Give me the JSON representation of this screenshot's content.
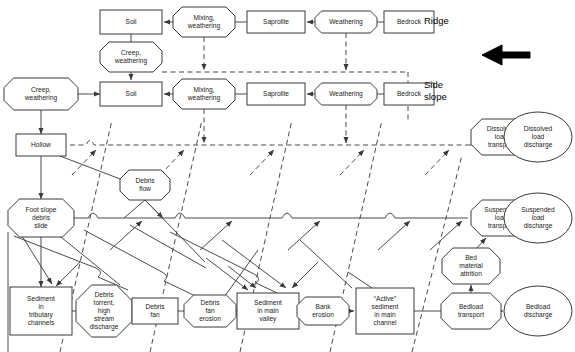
{
  "diagram": {
    "zone_labels": [
      {
        "id": "ridge",
        "text": "Ridge",
        "x": 424,
        "y": 24
      },
      {
        "id": "side-slope-1",
        "text": "Side",
        "x": 424,
        "y": 88
      },
      {
        "id": "side-slope-2",
        "text": "slope",
        "x": 424,
        "y": 100
      }
    ],
    "direction_arrow": {
      "name": "flow-direction-arrow",
      "points": "530,52 502,52 502,45 482,55 502,65 502,58 530,58",
      "tail_x": 530,
      "head_x": 482
    },
    "nodes": [
      {
        "id": "ridge-soil",
        "label": [
          "Soil"
        ],
        "shape": "rect",
        "cx": 131,
        "cy": 22,
        "w": 62,
        "h": 24
      },
      {
        "id": "ridge-mixing-weathering",
        "label": [
          "Mixing,",
          "weathering"
        ],
        "shape": "oct",
        "cx": 204,
        "cy": 22,
        "w": 62,
        "h": 30
      },
      {
        "id": "ridge-saprolite",
        "label": [
          "Saprolite"
        ],
        "shape": "rect",
        "cx": 276,
        "cy": 22,
        "w": 58,
        "h": 22
      },
      {
        "id": "ridge-weathering",
        "label": [
          "Weathering"
        ],
        "shape": "oct",
        "cx": 346,
        "cy": 22,
        "w": 62,
        "h": 22
      },
      {
        "id": "ridge-bedrock",
        "label": [
          "Bedrock"
        ],
        "shape": "rect",
        "cx": 409,
        "cy": 22,
        "w": 50,
        "h": 22
      },
      {
        "id": "ridge-creep-weathering",
        "label": [
          "Creep,",
          "weathering"
        ],
        "shape": "oct",
        "cx": 131,
        "cy": 57,
        "w": 62,
        "h": 30
      },
      {
        "id": "side-creep-weathering",
        "label": [
          "Creep,",
          "weathering"
        ],
        "shape": "oct",
        "cx": 41,
        "cy": 94,
        "w": 74,
        "h": 32
      },
      {
        "id": "side-soil",
        "label": [
          "Soil"
        ],
        "shape": "rect",
        "cx": 131,
        "cy": 94,
        "w": 62,
        "h": 24
      },
      {
        "id": "side-mixing-weathering",
        "label": [
          "Mixing,",
          "weathering"
        ],
        "shape": "oct",
        "cx": 204,
        "cy": 94,
        "w": 62,
        "h": 30
      },
      {
        "id": "side-saprolite",
        "label": [
          "Saprolite"
        ],
        "shape": "rect",
        "cx": 276,
        "cy": 94,
        "w": 58,
        "h": 22
      },
      {
        "id": "side-weathering",
        "label": [
          "Weathering"
        ],
        "shape": "oct",
        "cx": 346,
        "cy": 94,
        "w": 62,
        "h": 22
      },
      {
        "id": "side-bedrock",
        "label": [
          "Bedrock"
        ],
        "shape": "rect",
        "cx": 409,
        "cy": 94,
        "w": 50,
        "h": 22
      },
      {
        "id": "hollow",
        "label": [
          "Hollow"
        ],
        "shape": "rect",
        "cx": 41,
        "cy": 145,
        "w": 50,
        "h": 22
      },
      {
        "id": "debris-flow",
        "label": [
          "Debris",
          "flow"
        ],
        "shape": "oct",
        "cx": 145,
        "cy": 185,
        "w": 50,
        "h": 30
      },
      {
        "id": "foot-slope-debris-slide",
        "label": [
          "Foot slope",
          "debris",
          "slide"
        ],
        "shape": "oct",
        "cx": 41,
        "cy": 218,
        "w": 66,
        "h": 38
      },
      {
        "id": "dissolved-load-transport",
        "label": [
          "Dissolved",
          "load",
          "transport"
        ],
        "shape": "oct",
        "cx": 501,
        "cy": 137,
        "w": 60,
        "h": 36
      },
      {
        "id": "dissolved-load-discharge",
        "label": [
          "Dissolved",
          "load",
          "discharge"
        ],
        "shape": "ell",
        "cx": 538,
        "cy": 137,
        "w": 68,
        "h": 50
      },
      {
        "id": "suspended-load-transport",
        "label": [
          "Suspended",
          "load",
          "transport"
        ],
        "shape": "oct",
        "cx": 501,
        "cy": 218,
        "w": 60,
        "h": 36
      },
      {
        "id": "suspended-load-discharge",
        "label": [
          "Suspended",
          "load",
          "discharge"
        ],
        "shape": "ell",
        "cx": 538,
        "cy": 218,
        "w": 68,
        "h": 50
      },
      {
        "id": "bed-material-attrition",
        "label": [
          "Bed",
          "material",
          "attrition"
        ],
        "shape": "oct",
        "cx": 471,
        "cy": 266,
        "w": 58,
        "h": 36
      },
      {
        "id": "bedload-transport",
        "label": [
          "Bedload",
          "transport"
        ],
        "shape": "oct",
        "cx": 471,
        "cy": 311,
        "w": 60,
        "h": 36
      },
      {
        "id": "bedload-discharge",
        "label": [
          "Bedload",
          "discharge"
        ],
        "shape": "ell",
        "cx": 538,
        "cy": 311,
        "w": 68,
        "h": 50
      },
      {
        "id": "sediment-in-tributary-channels",
        "label": [
          "Sediment",
          "in",
          "tributary",
          "channels"
        ],
        "shape": "rect",
        "cx": 41,
        "cy": 311,
        "w": 62,
        "h": 48
      },
      {
        "id": "debris-torrent",
        "label": [
          "Debris",
          "torrent,",
          "high",
          "stream",
          "discharge"
        ],
        "shape": "oct",
        "cx": 104,
        "cy": 311,
        "w": 56,
        "h": 52
      },
      {
        "id": "debris-fan",
        "label": [
          "Debris",
          "fan"
        ],
        "shape": "rect",
        "cx": 155,
        "cy": 311,
        "w": 46,
        "h": 26
      },
      {
        "id": "debris-fan-erosion",
        "label": [
          "Debris",
          "fan",
          "erosion"
        ],
        "shape": "oct",
        "cx": 210,
        "cy": 311,
        "w": 52,
        "h": 32
      },
      {
        "id": "sediment-in-main-valley",
        "label": [
          "Sediment",
          "in main",
          "valley"
        ],
        "shape": "rect",
        "cx": 268,
        "cy": 311,
        "w": 62,
        "h": 36
      },
      {
        "id": "bank-erosion",
        "label": [
          "Bank",
          "erosion"
        ],
        "shape": "oct",
        "cx": 323,
        "cy": 311,
        "w": 52,
        "h": 28
      },
      {
        "id": "active-sediment-in-main-channel",
        "label": [
          "“Active”",
          "sediment",
          "in main",
          "channel"
        ],
        "shape": "rect",
        "cx": 385,
        "cy": 311,
        "w": 58,
        "h": 46
      }
    ],
    "transport_paths": [
      {
        "id": "dissolved-load-line",
        "style": "dashed",
        "y": 145
      },
      {
        "id": "suspended-load-line",
        "style": "solid",
        "y": 218
      }
    ]
  }
}
